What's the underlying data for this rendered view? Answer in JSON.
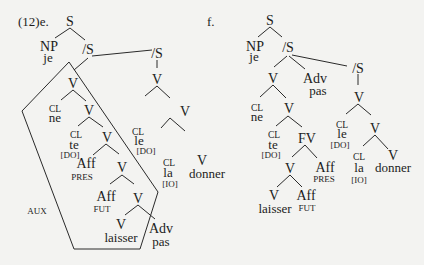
{
  "figure": {
    "example_e": "(12)e.",
    "example_f": "f.",
    "box_label": "AUX"
  },
  "tree_e": {
    "nodes": {
      "S": "S",
      "NP": "NP",
      "je": "je",
      "S_bar1": "/S",
      "V1": "V",
      "CL_ne": "CL",
      "ne": "ne",
      "V2": "V",
      "CL_te": "CL",
      "te": "te",
      "te_case": "[DO]",
      "V3": "V",
      "Aff_pres": "Aff",
      "pres": "PRES",
      "V4": "V",
      "Aff_fut": "Aff",
      "fut": "FUT",
      "V5": "V",
      "V_laisser": "V",
      "laisser": "laisser",
      "Adv": "Adv",
      "pas": "pas",
      "S_bar2": "/S",
      "V6": "V",
      "CL_le": "CL",
      "le": "le",
      "le_case": "[DO]",
      "V7": "V",
      "CL_la": "CL",
      "la": "la",
      "la_case": "[IO]",
      "V_donner": "V",
      "donner": "donner"
    }
  },
  "tree_f": {
    "nodes": {
      "S": "S",
      "NP": "NP",
      "je": "je",
      "S_bar1": "/S",
      "V1": "V",
      "Adv": "Adv",
      "pas": "pas",
      "CL_ne": "CL",
      "ne": "ne",
      "V2": "V",
      "CL_te": "CL",
      "te": "te",
      "te_case": "[DO]",
      "FV": "FV",
      "V3": "V",
      "Aff_pres": "Aff",
      "pres": "PRES",
      "V_laisser": "V",
      "laisser": "laisser",
      "Aff_fut": "Aff",
      "fut": "FUT",
      "S_bar2": "/S",
      "V6": "V",
      "CL_le": "CL",
      "le": "le",
      "le_case": "[DO]",
      "V7": "V",
      "CL_la": "CL",
      "la": "la",
      "la_case": "[IO]",
      "V_donner": "V",
      "donner": "donner"
    }
  }
}
